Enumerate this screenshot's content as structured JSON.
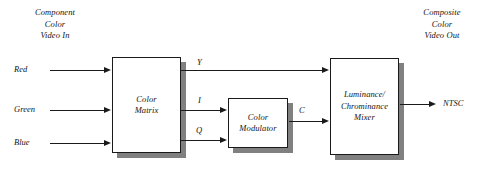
{
  "diagram": {
    "input_caption": {
      "line1": "Component",
      "line2": "Color",
      "line3": "Video In"
    },
    "output_caption": {
      "line1": "Composite",
      "line2": "Color",
      "line3": "Video Out"
    },
    "blocks": [
      {
        "id": "color-matrix",
        "line1": "Color",
        "line2": "Matrix"
      },
      {
        "id": "color-modulator",
        "line1": "Color",
        "line2": "Modulator"
      },
      {
        "id": "luminance-chrominance-mixer",
        "line1": "Luminance/",
        "line2": "Chrominance",
        "line3": "Mixer"
      }
    ],
    "inputs": [
      {
        "id": "red",
        "label": "Red"
      },
      {
        "id": "green",
        "label": "Green"
      },
      {
        "id": "blue",
        "label": "Blue"
      }
    ],
    "outputs": [
      {
        "id": "ntsc",
        "label": "NTSC"
      }
    ],
    "signals": [
      {
        "id": "y",
        "label": "Y"
      },
      {
        "id": "i",
        "label": "I"
      },
      {
        "id": "q",
        "label": "Q"
      },
      {
        "id": "c",
        "label": "C"
      }
    ],
    "colors": {
      "background": "#ffffff",
      "stroke": "#1a1a1a",
      "text": "#141414",
      "shadow": "#808080"
    }
  }
}
